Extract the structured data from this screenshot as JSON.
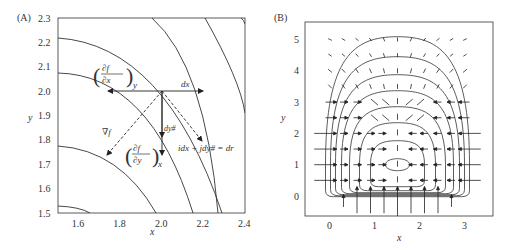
{
  "chart_data": [
    {
      "panel": "(A)",
      "type": "line",
      "title": "",
      "xlabel": "x",
      "ylabel": "y",
      "xlim": [
        1.5,
        2.4
      ],
      "ylim": [
        1.5,
        2.3
      ],
      "x_ticks": [
        "1.6",
        "1.8",
        "2.0",
        "2.2",
        "2.4"
      ],
      "y_ticks": [
        "1.5",
        "1.6",
        "1.7",
        "1.8",
        "1.9",
        "2.0",
        "2.1",
        "2.2",
        "2.3"
      ],
      "grid": false,
      "description": "Contour lines of f centered near origin; vectors drawn from point (2.0, 2.0)",
      "annotations": {
        "dfdx_y": "(∂f/∂x)_y",
        "dfdy_x": "(∂f/∂y)_x",
        "dx": "dx",
        "dy": "dy#",
        "grad": "∇f",
        "dr": "idx + jdy# = dr"
      },
      "point": [
        2.0,
        2.0
      ]
    },
    {
      "panel": "(B)",
      "type": "vector_field",
      "title": "",
      "xlabel": "x",
      "ylabel": "y",
      "xlim": [
        -0.5,
        3.5
      ],
      "ylim": [
        -0.6,
        5.6
      ],
      "x_ticks": [
        "0",
        "1",
        "2",
        "3"
      ],
      "y_ticks": [
        "0",
        "1",
        "2",
        "3",
        "4",
        "5"
      ],
      "grid": false,
      "description": "Vector field with closed streamlines around center (1.5, 1)"
    }
  ],
  "labels": {
    "panelA": "(A)",
    "panelB": "(B)",
    "xA": "x",
    "yA": "y",
    "xB": "x",
    "yB": "y",
    "dfdx": "∂f",
    "dxden": "∂x",
    "subY": "y",
    "dfdy": "∂f",
    "dyden": "∂y",
    "subX": "x",
    "dx": "dx",
    "dy": "dy#",
    "grad": "∇f",
    "dr": "idx + jdy# = dr"
  }
}
